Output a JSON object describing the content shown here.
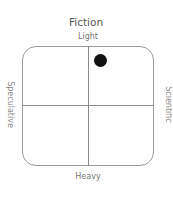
{
  "diagram": {
    "title": "Fiction",
    "axes": {
      "top": "Light",
      "bottom": "Heavy",
      "left": "Speculative",
      "right": "Scientific"
    },
    "marker": {
      "quadrant": "top-right",
      "color": "#111111"
    }
  }
}
